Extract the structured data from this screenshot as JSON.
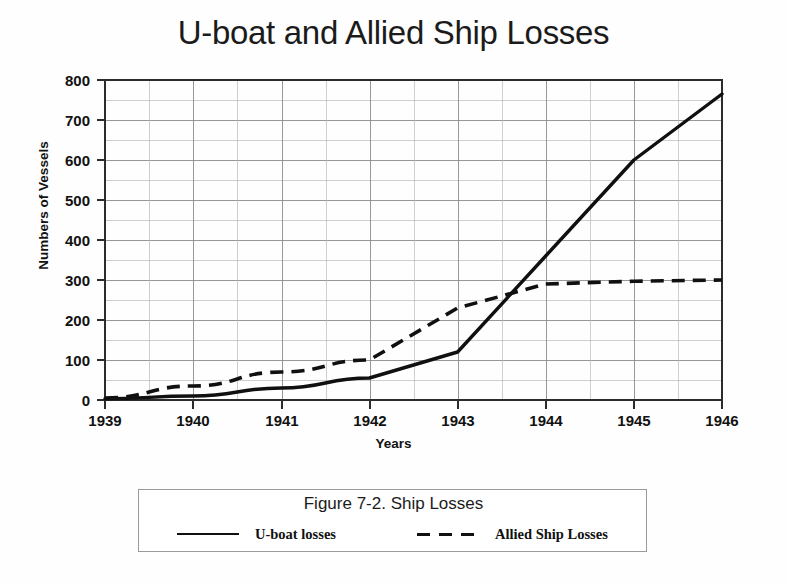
{
  "chart_title": "U-boat and Allied Ship Losses",
  "axes": {
    "xlabel": "Years",
    "ylabel": "Numbers of Vessels",
    "x_ticks": [
      "1939",
      "1940",
      "1941",
      "1942",
      "1943",
      "1944",
      "1945",
      "1946"
    ],
    "y_ticks": [
      "0",
      "100",
      "200",
      "300",
      "400",
      "500",
      "600",
      "700",
      "800"
    ]
  },
  "legend": {
    "caption": "Figure 7-2. Ship Losses",
    "entries": [
      {
        "label": "U-boat losses",
        "style": "solid"
      },
      {
        "label": "Allied Ship Losses",
        "style": "dashed"
      }
    ]
  },
  "chart_data": {
    "type": "line",
    "title": "U-boat and Allied Ship Losses",
    "subtitle": "Figure 7-2. Ship Losses",
    "xlabel": "Years",
    "ylabel": "Numbers of Vessels",
    "x": [
      1939,
      1940,
      1941,
      1942,
      1943,
      1944,
      1945,
      1946
    ],
    "xlim": [
      1939,
      1946
    ],
    "ylim": [
      0,
      800
    ],
    "y_major_step": 100,
    "y_minor_step": 50,
    "x_minor_step": 0.5,
    "grid": true,
    "legend_position": "below-plot",
    "series": [
      {
        "name": "U-boat losses",
        "style": "solid",
        "color": "#101010",
        "values": [
          3,
          10,
          30,
          55,
          120,
          360,
          600,
          765
        ]
      },
      {
        "name": "Allied Ship Losses",
        "style": "dashed",
        "color": "#101010",
        "values": [
          5,
          35,
          70,
          100,
          230,
          290,
          297,
          300
        ]
      }
    ],
    "annotations": [
      "Series cross between 1943 and 1944 at approximately 255 vessels",
      "U-boat losses show a sharp inflection at 1943",
      "Allied Ship Losses plateau near 300 after 1944"
    ]
  }
}
